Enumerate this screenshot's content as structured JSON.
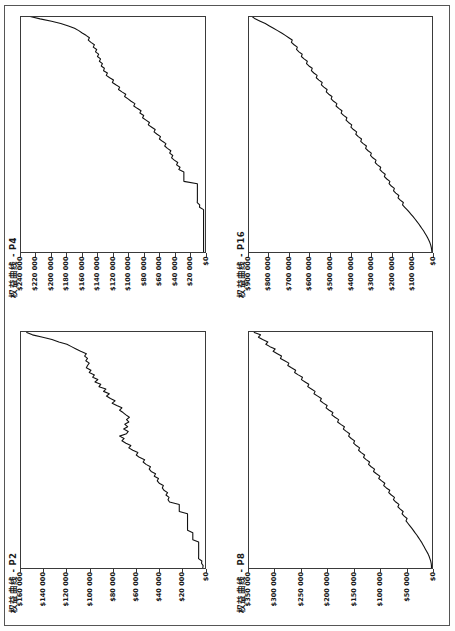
{
  "page": {
    "orientation": "rotated-90-ccw",
    "background_color": "#ffffff",
    "border_color": "#555555",
    "line_color": "#111111"
  },
  "charts": [
    {
      "id": "P2",
      "title": "权益曲线 - P2",
      "position": "top-left",
      "chart_data": {
        "type": "line",
        "title": "权益曲线 - P2",
        "xlabel": "",
        "ylabel": "",
        "grid": false,
        "legend": null,
        "ylim": [
          0,
          160000
        ],
        "ytick_labels": [
          "$160 000",
          "$140 000",
          "$120 000",
          "$100 000",
          "$80 000",
          "$60 000",
          "$40 000",
          "$20 000",
          "$0"
        ],
        "ytick_values": [
          160000,
          140000,
          120000,
          100000,
          80000,
          60000,
          40000,
          20000,
          0
        ],
        "x": [
          0,
          1,
          2,
          3,
          4,
          5,
          6,
          7,
          8,
          9,
          10,
          11,
          12,
          13,
          14,
          15,
          16,
          17,
          18,
          19,
          20,
          21,
          22,
          23,
          24,
          25,
          26,
          27,
          28,
          29,
          30,
          31,
          32,
          33,
          34,
          35,
          36,
          37,
          38,
          39,
          40,
          41,
          42,
          43,
          44,
          45,
          46,
          47,
          48,
          49,
          50,
          51,
          52,
          53,
          54,
          55,
          56,
          57,
          58,
          59,
          60,
          61,
          62,
          63,
          64,
          65,
          66,
          67,
          68,
          69,
          70,
          71,
          72,
          73,
          74,
          75,
          76,
          77,
          78,
          79,
          80,
          81,
          82,
          83,
          84,
          85,
          86,
          87,
          88,
          89,
          90,
          91,
          92,
          93,
          94,
          95,
          96,
          97,
          98,
          99,
          100
        ],
        "values": [
          1500,
          1200,
          2600,
          2300,
          5200,
          5100,
          5100,
          5100,
          5100,
          5100,
          5100,
          5100,
          10200,
          10200,
          10200,
          10200,
          14800,
          14800,
          14800,
          14800,
          14800,
          14800,
          14800,
          14800,
          22000,
          22000,
          22000,
          22000,
          30500,
          31800,
          30900,
          33600,
          32200,
          35400,
          36800,
          35900,
          39500,
          41200,
          40100,
          43800,
          42700,
          46500,
          48200,
          47100,
          51000,
          53500,
          52200,
          56800,
          59500,
          58100,
          62500,
          66000,
          64200,
          68500,
          72000,
          70100,
          74000,
          68000,
          66500,
          70500,
          67000,
          69500,
          66000,
          68000,
          65500,
          68500,
          71000,
          74000,
          72000,
          76500,
          80500,
          78000,
          82000,
          85500,
          83000,
          88000,
          86000,
          92000,
          90500,
          95500,
          93000,
          97500,
          96000,
          100500,
          99000,
          103000,
          102000,
          100500,
          103500,
          102000,
          104500,
          103000,
          108000,
          112000,
          116000,
          120000,
          127000,
          133000,
          141000,
          150000,
          155000
        ]
      }
    },
    {
      "id": "P4",
      "title": "权益曲线 - P4",
      "position": "top-right",
      "chart_data": {
        "type": "line",
        "title": "权益曲线 - P4",
        "xlabel": "",
        "ylabel": "",
        "grid": false,
        "legend": null,
        "ylim": [
          0,
          240000
        ],
        "ytick_labels": [
          "$240 000",
          "$220 000",
          "$200 000",
          "$180 000",
          "$160 000",
          "$140 000",
          "$120 000",
          "$100 000",
          "$80 000",
          "$60 000",
          "$40 000",
          "$20 000",
          "$0"
        ],
        "ytick_values": [
          240000,
          220000,
          200000,
          180000,
          160000,
          140000,
          120000,
          100000,
          80000,
          60000,
          40000,
          20000,
          0
        ],
        "x": [
          0,
          1,
          2,
          3,
          4,
          5,
          6,
          7,
          8,
          9,
          10,
          11,
          12,
          13,
          14,
          15,
          16,
          17,
          18,
          19,
          20,
          21,
          22,
          23,
          24,
          25,
          26,
          27,
          28,
          29,
          30,
          31,
          32,
          33,
          34,
          35,
          36,
          37,
          38,
          39,
          40,
          41,
          42,
          43,
          44,
          45,
          46,
          47,
          48,
          49,
          50,
          51,
          52,
          53,
          54,
          55,
          56,
          57,
          58,
          59,
          60,
          61,
          62,
          63,
          64,
          65,
          66,
          67,
          68,
          69,
          70,
          71,
          72,
          73,
          74,
          75,
          76,
          77,
          78,
          79,
          80,
          81,
          82,
          83,
          84,
          85,
          86,
          87,
          88,
          89,
          90,
          91,
          92,
          93,
          94,
          95,
          96,
          97,
          98,
          99,
          100
        ],
        "values": [
          1200,
          1200,
          1200,
          1200,
          1200,
          1200,
          1200,
          1200,
          1200,
          1200,
          1200,
          1200,
          1200,
          1200,
          1200,
          1200,
          1200,
          1200,
          1200,
          6500,
          6300,
          9500,
          9300,
          9300,
          9300,
          9300,
          9300,
          9300,
          9300,
          9300,
          27000,
          27000,
          27000,
          27000,
          27000,
          33500,
          32000,
          36500,
          35000,
          39500,
          43000,
          41500,
          45500,
          44000,
          48500,
          52000,
          50500,
          55000,
          59000,
          57500,
          62000,
          66000,
          64500,
          69000,
          73500,
          72000,
          76500,
          81000,
          79500,
          84500,
          83000,
          88000,
          92500,
          91000,
          96000,
          100000,
          104500,
          103000,
          108000,
          112500,
          111000,
          116000,
          120500,
          119000,
          124000,
          128500,
          127000,
          132000,
          131000,
          135000,
          133500,
          137500,
          136000,
          140000,
          138500,
          142500,
          141000,
          145500,
          144000,
          148500,
          152000,
          150500,
          155000,
          160000,
          164500,
          170000,
          178000,
          188000,
          200000,
          215000,
          228000
        ]
      }
    },
    {
      "id": "P8",
      "title": "权益曲线 - P8",
      "position": "bottom-left",
      "chart_data": {
        "type": "line",
        "title": "权益曲线 - P8",
        "xlabel": "",
        "ylabel": "",
        "grid": false,
        "legend": null,
        "ylim": [
          0,
          350000
        ],
        "ytick_labels": [
          "$350 000",
          "$300 000",
          "$250 000",
          "$200 000",
          "$150 000",
          "$100 000",
          "$50 000",
          "$0"
        ],
        "ytick_values": [
          350000,
          300000,
          250000,
          200000,
          150000,
          100000,
          50000,
          0
        ],
        "x": [
          0,
          1,
          2,
          3,
          4,
          5,
          6,
          7,
          8,
          9,
          10,
          11,
          12,
          13,
          14,
          15,
          16,
          17,
          18,
          19,
          20,
          21,
          22,
          23,
          24,
          25,
          26,
          27,
          28,
          29,
          30,
          31,
          32,
          33,
          34,
          35,
          36,
          37,
          38,
          39,
          40,
          41,
          42,
          43,
          44,
          45,
          46,
          47,
          48,
          49,
          50,
          51,
          52,
          53,
          54,
          55,
          56,
          57,
          58,
          59,
          60,
          61,
          62,
          63,
          64,
          65,
          66,
          67,
          68,
          69,
          70,
          71,
          72,
          73,
          74,
          75,
          76,
          77,
          78,
          79,
          80,
          81,
          82,
          83,
          84,
          85,
          86,
          87,
          88,
          89,
          90,
          91,
          92,
          93,
          94,
          95,
          96,
          97,
          98,
          99,
          100
        ],
        "values": [
          2000,
          2000,
          2500,
          3500,
          5000,
          6500,
          8500,
          11000,
          13500,
          16000,
          18500,
          21000,
          24000,
          27000,
          30000,
          33500,
          36500,
          40000,
          43500,
          47000,
          50500,
          48500,
          54000,
          58000,
          56000,
          61500,
          66000,
          64000,
          70000,
          74500,
          72500,
          78500,
          83500,
          81500,
          88000,
          93000,
          91000,
          97000,
          102500,
          100500,
          107000,
          112500,
          110500,
          117000,
          122000,
          120000,
          126500,
          131500,
          129500,
          136000,
          141000,
          139000,
          145500,
          150500,
          148500,
          155000,
          160000,
          158000,
          164500,
          170000,
          168000,
          175000,
          181000,
          179000,
          186000,
          192000,
          190000,
          197000,
          203000,
          201000,
          208000,
          214000,
          212000,
          219000,
          226000,
          224000,
          231000,
          238000,
          236000,
          243000,
          250000,
          248000,
          256000,
          263000,
          261000,
          269000,
          276000,
          274000,
          282000,
          290000,
          288000,
          296000,
          304000,
          300000,
          310000,
          318000,
          314000,
          324000,
          332000,
          328000,
          340000
        ]
      }
    },
    {
      "id": "P16",
      "title": "权益曲线 - P16",
      "position": "bottom-right",
      "chart_data": {
        "type": "line",
        "title": "权益曲线 - P16",
        "xlabel": "",
        "ylabel": "",
        "grid": false,
        "legend": null,
        "ylim": [
          0,
          900000
        ],
        "ytick_labels": [
          "$900 000",
          "$800 000",
          "$700 000",
          "$600 000",
          "$500 000",
          "$400 000",
          "$300 000",
          "$200 000",
          "$100 000",
          "$0"
        ],
        "ytick_values": [
          900000,
          800000,
          700000,
          600000,
          500000,
          400000,
          300000,
          200000,
          100000,
          0
        ],
        "x": [
          0,
          1,
          2,
          3,
          4,
          5,
          6,
          7,
          8,
          9,
          10,
          11,
          12,
          13,
          14,
          15,
          16,
          17,
          18,
          19,
          20,
          21,
          22,
          23,
          24,
          25,
          26,
          27,
          28,
          29,
          30,
          31,
          32,
          33,
          34,
          35,
          36,
          37,
          38,
          39,
          40,
          41,
          42,
          43,
          44,
          45,
          46,
          47,
          48,
          49,
          50,
          51,
          52,
          53,
          54,
          55,
          56,
          57,
          58,
          59,
          60,
          61,
          62,
          63,
          64,
          65,
          66,
          67,
          68,
          69,
          70,
          71,
          72,
          73,
          74,
          75,
          76,
          77,
          78,
          79,
          80,
          81,
          82,
          83,
          84,
          85,
          86,
          87,
          88,
          89,
          90,
          91,
          92,
          93,
          94,
          95,
          96,
          97,
          98,
          99,
          100
        ],
        "values": [
          3000,
          4000,
          6000,
          9000,
          13000,
          18000,
          24000,
          30000,
          37000,
          44000,
          52000,
          60000,
          68000,
          77000,
          86000,
          95000,
          105000,
          115000,
          125000,
          136000,
          147000,
          143000,
          158000,
          169000,
          165000,
          180000,
          191000,
          187000,
          202000,
          213000,
          209000,
          224000,
          236000,
          232000,
          247000,
          258000,
          254000,
          270000,
          281000,
          277000,
          293000,
          304000,
          300000,
          316000,
          328000,
          324000,
          340000,
          352000,
          348000,
          364000,
          376000,
          372000,
          388000,
          400000,
          396000,
          412000,
          424000,
          420000,
          436000,
          448000,
          444000,
          460000,
          473000,
          469000,
          485000,
          497000,
          493000,
          509000,
          521000,
          517000,
          533000,
          545000,
          541000,
          557000,
          570000,
          566000,
          582000,
          594000,
          590000,
          606000,
          618000,
          614000,
          630000,
          643000,
          639000,
          655000,
          667000,
          663000,
          679000,
          692000,
          688000,
          705000,
          722000,
          740000,
          760000,
          780000,
          800000,
          820000,
          845000,
          870000,
          885000
        ]
      }
    }
  ]
}
